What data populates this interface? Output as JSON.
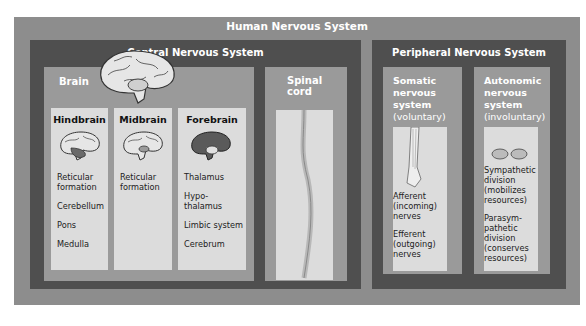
{
  "title": "Human Nervous System",
  "central": {
    "title": "Central Nervous System",
    "brain": {
      "label": "Brain",
      "columns": [
        {
          "heading": "Hindbrain",
          "items": [
            "Reticular formation",
            "Cerebellum",
            "Pons",
            "Medulla"
          ]
        },
        {
          "heading": "Midbrain",
          "items": [
            "Reticular formation"
          ]
        },
        {
          "heading": "Forebrain",
          "items": [
            "Thalamus",
            "Hypo-thalamus",
            "Limbic system",
            "Cerebrum"
          ]
        }
      ]
    },
    "spinal": {
      "label_line1": "Spinal",
      "label_line2": "cord"
    }
  },
  "peripheral": {
    "title": "Peripheral Nervous System",
    "somatic": {
      "title_lines": [
        "Somatic",
        "nervous",
        "system"
      ],
      "subtitle": "(voluntary)",
      "items": [
        "Afferent (incoming) nerves",
        "Efferent (outgoing) nerves"
      ]
    },
    "autonomic": {
      "title_lines": [
        "Autonomic",
        "nervous",
        "system"
      ],
      "subtitle": "(involuntary)",
      "items": [
        "Sympathetic division (mobilizes resources)",
        "Parasym-pathetic division (conserves resources)"
      ]
    }
  }
}
